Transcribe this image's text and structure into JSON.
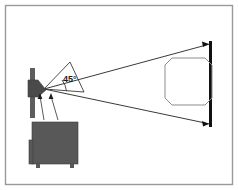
{
  "figure": {
    "background_color": "#ffffff",
    "border_color": "#9a9a9a",
    "line_color": "#3a3a3a",
    "screen_color": "#111111",
    "cabinet_color": "#585858",
    "cabinet_edge_color": "#3c3c3c",
    "projector_head_color": "#4a4a4a",
    "post_color": "#5d5d5d",
    "image_outline_color": "#8d8d8d"
  },
  "annotations": {
    "angle_label": "45°",
    "angle_value": 45,
    "angle_unit": "degrees"
  },
  "elements": {
    "border_frame": "border-frame",
    "projector": "projector-unit",
    "projector_head": "projector-head",
    "projector_post": "projector-post",
    "cabinet": "equipment-cabinet",
    "cabinet_legs": "cabinet-legs",
    "beam_upper": "beam-upper-edge",
    "beam_lower": "beam-lower-edge",
    "angle_arc": "angle-arc",
    "angle_reference_line": "angle-reference-line",
    "screen": "projection-screen",
    "screen_arrow_top": "screen-arrow-top",
    "screen_arrow_bottom": "screen-arrow-bottom",
    "projected_image": "projected-image-area",
    "lens_arrow_left": "lens-indicator-arrow-left",
    "lens_arrow_right": "lens-indicator-arrow-right",
    "leader_line_left": "leader-line-left",
    "leader_line_right": "leader-line-right"
  }
}
